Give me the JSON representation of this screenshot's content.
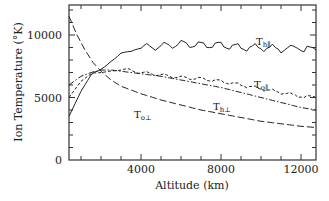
{
  "chart_data": {
    "type": "line",
    "title": "",
    "xlabel": "Altitude (km)",
    "ylabel": "Ion Temperature (°K)",
    "xlim": [
      400,
      12750
    ],
    "ylim": [
      0,
      12400
    ],
    "xticks": [
      4000,
      8000,
      12000
    ],
    "xtick_labels": [
      "4000",
      "8000",
      "12000"
    ],
    "x_minor_step": 1000,
    "yticks": [
      0,
      5000,
      10000
    ],
    "ytick_labels": [
      "0",
      "5000",
      "10000"
    ],
    "y_minor_step": 1000,
    "grid": false,
    "legend": "inline labels",
    "series": [
      {
        "name": "T_h∥",
        "label_main": "T",
        "label_sub": "h∥",
        "style": "solid",
        "x": [
          400,
          1000,
          1500,
          2000,
          2500,
          3000,
          3500,
          4000,
          5000,
          6000,
          7000,
          8000,
          9000,
          10000,
          11000,
          11500,
          12000,
          12750
        ],
        "values": [
          3500,
          5500,
          6800,
          7500,
          8300,
          8800,
          8700,
          9000,
          9100,
          9300,
          9200,
          9200,
          9000,
          9000,
          8900,
          9300,
          8900,
          8800
        ]
      },
      {
        "name": "T_o∥",
        "label_main": "T",
        "label_sub": "o∥",
        "style": "dashed",
        "x": [
          400,
          1000,
          1500,
          2000,
          2500,
          3000,
          4000,
          5000,
          6000,
          7000,
          8000,
          9000,
          10000,
          11000,
          12000,
          12750
        ],
        "values": [
          5000,
          6300,
          6900,
          7100,
          7300,
          7300,
          7000,
          6800,
          6600,
          6500,
          6300,
          6000,
          5700,
          5400,
          5100,
          5000
        ]
      },
      {
        "name": "T_h⊥",
        "label_main": "T",
        "label_sub": "h⊥",
        "style": "dash-dot",
        "x": [
          400,
          1000,
          1500,
          2000,
          2500,
          3000,
          4000,
          5000,
          6000,
          7000,
          8000,
          9000,
          10000,
          11000,
          12000,
          12750
        ],
        "values": [
          6000,
          6700,
          7000,
          7200,
          7200,
          7100,
          6900,
          6700,
          6400,
          6100,
          5800,
          5400,
          5000,
          4600,
          4200,
          4000
        ]
      },
      {
        "name": "T_o⊥",
        "label_main": "T",
        "label_sub": "o⊥",
        "style": "long-dash",
        "x": [
          400,
          800,
          1200,
          1600,
          2000,
          2500,
          3000,
          4000,
          5000,
          6000,
          7000,
          8000,
          9000,
          10000,
          11000,
          12000,
          12750
        ],
        "values": [
          11500,
          10000,
          8800,
          7800,
          7100,
          6400,
          5900,
          5300,
          4800,
          4400,
          4000,
          3700,
          3400,
          3100,
          2900,
          2700,
          2600
        ]
      }
    ]
  }
}
